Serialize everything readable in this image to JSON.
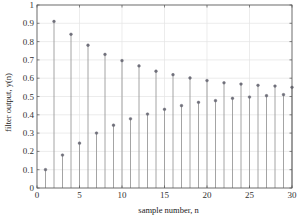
{
  "chart_data": {
    "type": "stem",
    "title": "",
    "xlabel": "sample number, n",
    "ylabel": "filter output, y(n)",
    "xlim": [
      0,
      30
    ],
    "ylim": [
      0,
      1
    ],
    "grid": true,
    "legend": null,
    "x_ticks": [
      0,
      5,
      10,
      15,
      20,
      25,
      30
    ],
    "x_tick_labels": [
      "0",
      "5",
      "10",
      "15",
      "20",
      "25",
      "30"
    ],
    "y_ticks": [
      0,
      0.1,
      0.2,
      0.3,
      0.4,
      0.5,
      0.6,
      0.7,
      0.8,
      0.9,
      1
    ],
    "y_tick_labels": [
      "0",
      "0.1",
      "0.2",
      "0.3",
      "0.4",
      "0.5",
      "0.6",
      "0.7",
      "0.8",
      "0.9",
      "1"
    ],
    "x": [
      1,
      2,
      3,
      4,
      5,
      6,
      7,
      8,
      9,
      10,
      11,
      12,
      13,
      14,
      15,
      16,
      17,
      18,
      19,
      20,
      21,
      22,
      23,
      24,
      25,
      26,
      27,
      28,
      29,
      30
    ],
    "values": [
      0.1,
      0.91,
      0.18,
      0.84,
      0.245,
      0.78,
      0.3,
      0.73,
      0.343,
      0.696,
      0.378,
      0.667,
      0.404,
      0.638,
      0.43,
      0.619,
      0.45,
      0.601,
      0.468,
      0.587,
      0.477,
      0.575,
      0.49,
      0.568,
      0.497,
      0.561,
      0.504,
      0.557,
      0.51,
      0.55
    ],
    "colors": {
      "stem": "#9a9a9a",
      "marker": "#6f6f7a",
      "axis": "#555555",
      "grid": "#e4e4e4"
    }
  }
}
